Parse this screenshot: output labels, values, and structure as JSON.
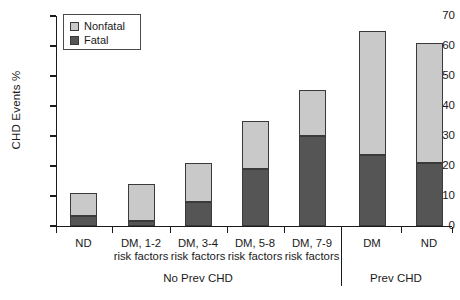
{
  "chart_data": {
    "type": "bar",
    "subtype": "stacked",
    "title": "",
    "xlabel": "",
    "ylabel": "CHD Events %",
    "ylim": [
      0,
      70
    ],
    "yticks": [
      0,
      10,
      20,
      30,
      40,
      50,
      60,
      70
    ],
    "grid": false,
    "legend_position": "top-left",
    "categories": [
      "ND",
      "DM, 1-2 risk factors",
      "DM, 3-4 risk factors",
      "DM, 5-8 risk factors",
      "DM, 7-9 risk factors",
      "DM",
      "ND"
    ],
    "category_lines": [
      [
        "ND",
        ""
      ],
      [
        "DM, 1-2",
        "risk factors"
      ],
      [
        "DM, 3-4",
        "risk factors"
      ],
      [
        "DM, 5-8",
        "risk factors"
      ],
      [
        "DM, 7-9",
        "risk factors"
      ],
      [
        "DM",
        ""
      ],
      [
        "ND",
        ""
      ]
    ],
    "series": [
      {
        "name": "Fatal",
        "color": "#555555",
        "values": [
          3.3,
          1.8,
          8.0,
          19.0,
          30.0,
          23.8,
          21.0
        ]
      },
      {
        "name": "Nonfatal",
        "color": "#c9c9c9",
        "values": [
          7.7,
          12.2,
          13.0,
          16.0,
          15.5,
          41.2,
          40.0
        ]
      }
    ],
    "totals": [
      11.0,
      14.0,
      21.0,
      35.0,
      45.5,
      65.0,
      61.0
    ],
    "groups": [
      {
        "label": "No Prev CHD",
        "categories": [
          0,
          1,
          2,
          3,
          4
        ]
      },
      {
        "label": "Prev CHD",
        "categories": [
          5,
          6
        ]
      }
    ]
  },
  "legend": {
    "items": [
      {
        "label": "Nonfatal",
        "color": "#c9c9c9"
      },
      {
        "label": "Fatal",
        "color": "#555555"
      }
    ]
  },
  "axis": {
    "y_title": "CHD Events %",
    "y_tick_labels": [
      "70",
      "60",
      "50",
      "40",
      "30",
      "20",
      "10",
      "0"
    ]
  }
}
